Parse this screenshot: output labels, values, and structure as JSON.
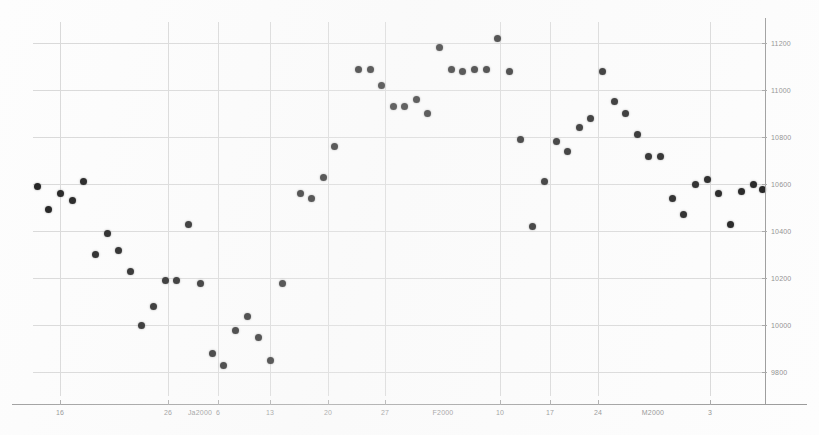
{
  "chart_data": {
    "type": "scatter",
    "title": "",
    "subtitle": "",
    "xlabel": "",
    "ylabel": "",
    "grid": true,
    "legend": false,
    "ylim": [
      9700,
      11290
    ],
    "y_ticks": [
      11200,
      11000,
      10800,
      10600,
      10400,
      10200,
      10000,
      9800
    ],
    "y_tick_labels": [
      "11200",
      "11000",
      "10800",
      "10600",
      "10400",
      "10200",
      "10000",
      "9800"
    ],
    "x_tick_labels": [
      "16",
      "26",
      "Ja2000",
      "6",
      "13",
      "20",
      "27",
      "F2000",
      "10",
      "17",
      "24",
      "M2000",
      "3"
    ],
    "x_tick_positions": [
      60,
      168,
      200,
      218,
      270,
      328,
      385,
      443,
      500,
      550,
      598,
      653,
      710
    ],
    "marker_color": "#161616",
    "grid_color": "#d8d8d8",
    "axis_color": "#9a9a9a",
    "points": [
      {
        "x": 37,
        "y": 10590
      },
      {
        "x": 48,
        "y": 10495
      },
      {
        "x": 60,
        "y": 10560
      },
      {
        "x": 72,
        "y": 10530
      },
      {
        "x": 83,
        "y": 10610
      },
      {
        "x": 95,
        "y": 10300
      },
      {
        "x": 107,
        "y": 10390
      },
      {
        "x": 118,
        "y": 10320
      },
      {
        "x": 130,
        "y": 10230
      },
      {
        "x": 141,
        "y": 10000
      },
      {
        "x": 153,
        "y": 10080
      },
      {
        "x": 165,
        "y": 10190
      },
      {
        "x": 176,
        "y": 10190
      },
      {
        "x": 188,
        "y": 10430
      },
      {
        "x": 200,
        "y": 10180
      },
      {
        "x": 212,
        "y": 9880
      },
      {
        "x": 223,
        "y": 9830
      },
      {
        "x": 235,
        "y": 9980
      },
      {
        "x": 247,
        "y": 10040
      },
      {
        "x": 258,
        "y": 9950
      },
      {
        "x": 270,
        "y": 9850
      },
      {
        "x": 282,
        "y": 10180
      },
      {
        "x": 300,
        "y": 10560
      },
      {
        "x": 311,
        "y": 10540
      },
      {
        "x": 323,
        "y": 10630
      },
      {
        "x": 334,
        "y": 10760
      },
      {
        "x": 358,
        "y": 11090
      },
      {
        "x": 370,
        "y": 11090
      },
      {
        "x": 381,
        "y": 11020
      },
      {
        "x": 393,
        "y": 10930
      },
      {
        "x": 404,
        "y": 10930
      },
      {
        "x": 416,
        "y": 10960
      },
      {
        "x": 427,
        "y": 10900
      },
      {
        "x": 439,
        "y": 11180
      },
      {
        "x": 451,
        "y": 11090
      },
      {
        "x": 462,
        "y": 11080
      },
      {
        "x": 474,
        "y": 11090
      },
      {
        "x": 486,
        "y": 11090
      },
      {
        "x": 497,
        "y": 11220
      },
      {
        "x": 509,
        "y": 11080
      },
      {
        "x": 520,
        "y": 10790
      },
      {
        "x": 532,
        "y": 10420
      },
      {
        "x": 544,
        "y": 10610
      },
      {
        "x": 556,
        "y": 10780
      },
      {
        "x": 567,
        "y": 10740
      },
      {
        "x": 579,
        "y": 10840
      },
      {
        "x": 590,
        "y": 10880
      },
      {
        "x": 602,
        "y": 11080
      },
      {
        "x": 614,
        "y": 10950
      },
      {
        "x": 625,
        "y": 10900
      },
      {
        "x": 637,
        "y": 10810
      },
      {
        "x": 648,
        "y": 10720
      },
      {
        "x": 660,
        "y": 10720
      },
      {
        "x": 672,
        "y": 10540
      },
      {
        "x": 683,
        "y": 10470
      },
      {
        "x": 695,
        "y": 10600
      },
      {
        "x": 707,
        "y": 10620
      },
      {
        "x": 718,
        "y": 10560
      },
      {
        "x": 730,
        "y": 10430
      },
      {
        "x": 741,
        "y": 10570
      },
      {
        "x": 753,
        "y": 10600
      },
      {
        "x": 762,
        "y": 10580
      }
    ]
  }
}
